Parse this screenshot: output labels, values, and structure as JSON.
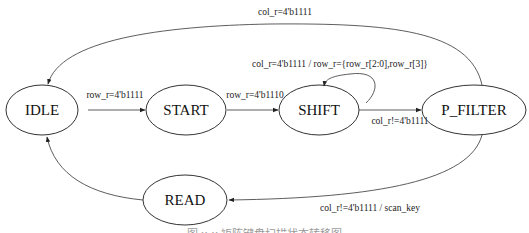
{
  "diagram": {
    "type": "state-machine",
    "states": [
      {
        "id": "idle",
        "label": "IDLE"
      },
      {
        "id": "start",
        "label": "START"
      },
      {
        "id": "shift",
        "label": "SHIFT"
      },
      {
        "id": "p_filter",
        "label": "P_FILTER"
      },
      {
        "id": "read",
        "label": "READ"
      }
    ],
    "transitions": [
      {
        "from": "IDLE",
        "to": "START",
        "label": "row_r=4'b1111"
      },
      {
        "from": "START",
        "to": "SHIFT",
        "label": "row_r=4'b1110"
      },
      {
        "from": "SHIFT",
        "to": "SHIFT",
        "label": "col_r=4'b1111  / row_r={row_r[2:0],row_r[3]}"
      },
      {
        "from": "SHIFT",
        "to": "P_FILTER",
        "label": "col_r!=4'b1111"
      },
      {
        "from": "P_FILTER",
        "to": "IDLE",
        "label": "col_r=4'b1111"
      },
      {
        "from": "P_FILTER",
        "to": "READ",
        "label": "col_r!=4'b1111  / scan_key"
      },
      {
        "from": "READ",
        "to": "IDLE",
        "label": ""
      }
    ],
    "caption": "图 x-x  矩阵键盘扫描状态转移图"
  }
}
